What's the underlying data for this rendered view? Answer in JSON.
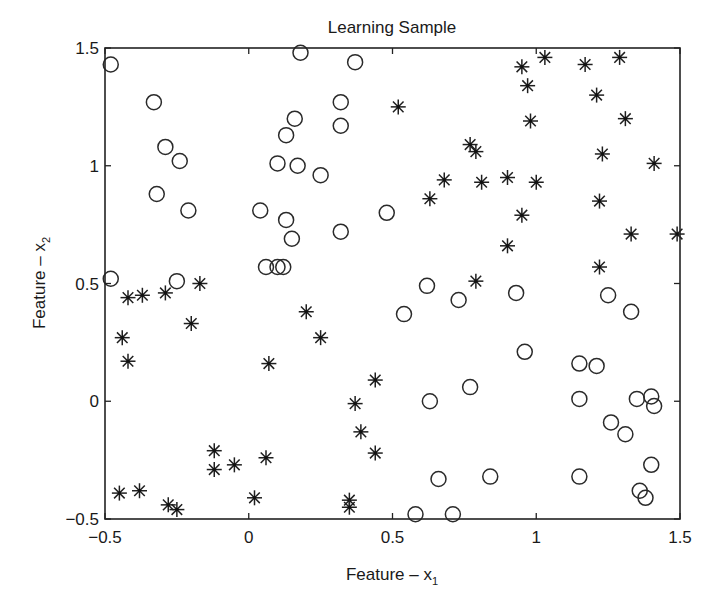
{
  "chart_data": {
    "type": "scatter",
    "title": "Learning Sample",
    "xlabel": "Feature – x",
    "xlabel_sub": "1",
    "ylabel": "Feature – x",
    "ylabel_sub": "2",
    "xlim": [
      -0.5,
      1.5
    ],
    "ylim": [
      -0.5,
      1.5
    ],
    "xticks": [
      -0.5,
      0,
      0.5,
      1,
      1.5
    ],
    "xtick_labels": [
      "−0.5",
      "0",
      "0.5",
      "1",
      "1.5"
    ],
    "yticks": [
      -0.5,
      0,
      0.5,
      1,
      1.5
    ],
    "ytick_labels": [
      "−0.5",
      "0",
      "0.5",
      "1",
      "1.5"
    ],
    "grid": false,
    "legend": "none",
    "series": [
      {
        "name": "class-circle",
        "marker": "o",
        "points": [
          [
            -0.48,
            1.43
          ],
          [
            -0.33,
            1.27
          ],
          [
            -0.29,
            1.08
          ],
          [
            -0.24,
            1.02
          ],
          [
            -0.32,
            0.88
          ],
          [
            -0.21,
            0.81
          ],
          [
            0.18,
            1.48
          ],
          [
            0.37,
            1.44
          ],
          [
            0.32,
            1.27
          ],
          [
            0.32,
            1.17
          ],
          [
            0.16,
            1.2
          ],
          [
            0.13,
            1.13
          ],
          [
            0.1,
            1.01
          ],
          [
            0.17,
            1.0
          ],
          [
            0.25,
            0.96
          ],
          [
            0.04,
            0.81
          ],
          [
            0.13,
            0.77
          ],
          [
            0.15,
            0.69
          ],
          [
            0.32,
            0.72
          ],
          [
            0.48,
            0.8
          ],
          [
            -0.48,
            0.52
          ],
          [
            -0.25,
            0.51
          ],
          [
            0.06,
            0.57
          ],
          [
            0.1,
            0.57
          ],
          [
            0.12,
            0.57
          ],
          [
            0.62,
            0.49
          ],
          [
            0.54,
            0.37
          ],
          [
            0.73,
            0.43
          ],
          [
            0.93,
            0.46
          ],
          [
            1.25,
            0.45
          ],
          [
            1.33,
            0.38
          ],
          [
            0.96,
            0.21
          ],
          [
            1.15,
            0.16
          ],
          [
            1.21,
            0.15
          ],
          [
            0.77,
            0.06
          ],
          [
            0.63,
            0.0
          ],
          [
            1.15,
            0.01
          ],
          [
            1.35,
            0.01
          ],
          [
            1.4,
            0.02
          ],
          [
            1.41,
            -0.02
          ],
          [
            1.26,
            -0.09
          ],
          [
            1.31,
            -0.14
          ],
          [
            1.4,
            -0.27
          ],
          [
            0.66,
            -0.33
          ],
          [
            0.84,
            -0.32
          ],
          [
            1.15,
            -0.32
          ],
          [
            1.36,
            -0.38
          ],
          [
            1.38,
            -0.41
          ],
          [
            0.58,
            -0.48
          ],
          [
            0.71,
            -0.48
          ]
        ]
      },
      {
        "name": "class-star",
        "marker": "*",
        "points": [
          [
            0.52,
            1.25
          ],
          [
            0.95,
            1.42
          ],
          [
            1.03,
            1.46
          ],
          [
            1.17,
            1.43
          ],
          [
            1.29,
            1.46
          ],
          [
            0.97,
            1.34
          ],
          [
            0.98,
            1.19
          ],
          [
            1.21,
            1.3
          ],
          [
            1.31,
            1.2
          ],
          [
            0.77,
            1.09
          ],
          [
            0.79,
            1.06
          ],
          [
            1.23,
            1.05
          ],
          [
            1.41,
            1.01
          ],
          [
            0.63,
            0.86
          ],
          [
            0.68,
            0.94
          ],
          [
            0.81,
            0.93
          ],
          [
            0.9,
            0.95
          ],
          [
            1.0,
            0.93
          ],
          [
            0.95,
            0.79
          ],
          [
            1.22,
            0.85
          ],
          [
            0.9,
            0.66
          ],
          [
            1.33,
            0.71
          ],
          [
            1.49,
            0.71
          ],
          [
            1.22,
            0.57
          ],
          [
            0.79,
            0.51
          ],
          [
            -0.17,
            0.5
          ],
          [
            -0.42,
            0.44
          ],
          [
            -0.37,
            0.45
          ],
          [
            -0.29,
            0.46
          ],
          [
            -0.2,
            0.33
          ],
          [
            -0.44,
            0.27
          ],
          [
            -0.42,
            0.17
          ],
          [
            0.2,
            0.38
          ],
          [
            0.25,
            0.27
          ],
          [
            0.07,
            0.16
          ],
          [
            0.44,
            0.09
          ],
          [
            0.37,
            -0.01
          ],
          [
            0.39,
            -0.13
          ],
          [
            0.44,
            -0.22
          ],
          [
            -0.12,
            -0.21
          ],
          [
            -0.12,
            -0.29
          ],
          [
            -0.05,
            -0.27
          ],
          [
            0.06,
            -0.24
          ],
          [
            -0.45,
            -0.39
          ],
          [
            -0.38,
            -0.38
          ],
          [
            -0.28,
            -0.44
          ],
          [
            -0.25,
            -0.46
          ],
          [
            0.02,
            -0.41
          ],
          [
            0.35,
            -0.42
          ],
          [
            0.35,
            -0.45
          ]
        ]
      }
    ]
  }
}
